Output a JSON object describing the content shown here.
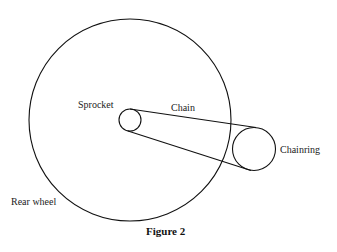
{
  "labels": {
    "sprocket": "Sprocket",
    "chain": "Chain",
    "chainring": "Chainring",
    "rear_wheel": "Rear wheel"
  },
  "caption": "Figure 2",
  "colors": {
    "stroke": "#111111",
    "background": "#ffffff"
  }
}
